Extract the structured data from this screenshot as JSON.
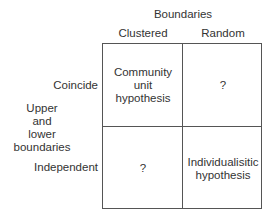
{
  "diagram": {
    "column_axis_title": "Boundaries",
    "columns": [
      "Clustered",
      "Random"
    ],
    "row_axis_title": [
      "Upper",
      "and",
      "lower",
      "boundaries"
    ],
    "rows": [
      "Coincide",
      "Independent"
    ],
    "cells": [
      [
        "Community unit hypothesis",
        "?"
      ],
      [
        "?",
        "Individualisitic hypothesis"
      ]
    ],
    "cell_lines": {
      "r0c0": [
        "Community",
        "unit",
        "hypothesis"
      ],
      "r0c1": [
        "?"
      ],
      "r1c0": [
        "?"
      ],
      "r1c1": [
        "Individualisitic",
        "hypothesis"
      ]
    }
  }
}
